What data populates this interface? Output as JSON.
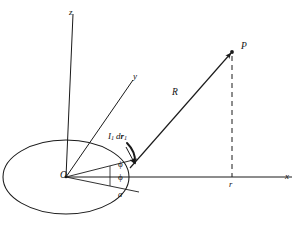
{
  "figure": {
    "kind": "vector-diagram",
    "background_color": "#ffffff",
    "stroke_color": "#1a1a1a"
  },
  "axes": {
    "z": {
      "label": "z",
      "x": 69,
      "y": 8
    },
    "y": {
      "label": "y",
      "x": 133,
      "y": 72
    },
    "x": {
      "label": "x",
      "x": 285,
      "y": 172
    }
  },
  "points": {
    "origin": {
      "label": "O",
      "x": 60,
      "y": 171
    },
    "field_point": {
      "label": "P",
      "x": 241,
      "y": 42
    }
  },
  "vectors": {
    "R": {
      "label": "R",
      "x": 172,
      "y": 88
    },
    "current_element": {
      "symbol_current": "I",
      "symbol_current_sub": "1",
      "symbol_d": "d",
      "symbol_vector": "r",
      "symbol_vector_sub": "1",
      "x": 108,
      "y": 132
    }
  },
  "angles": {
    "phi_upper": {
      "label": "ϕ",
      "x": 118,
      "y": 160
    },
    "phi_lower": {
      "label": "ϕ",
      "x": 118,
      "y": 173
    }
  },
  "lengths": {
    "loop_radius": {
      "label": "a",
      "x": 118,
      "y": 190
    },
    "field_distance": {
      "label": "r",
      "x": 229,
      "y": 180
    }
  },
  "geometry": {
    "origin_px": [
      66,
      177
    ],
    "loop_rx": 63,
    "loop_ry": 37,
    "z_axis_top": [
      73,
      14
    ],
    "y_axis_end": [
      133,
      80
    ],
    "x_axis_end": [
      292,
      177
    ],
    "point_P_px": [
      232,
      52
    ],
    "foot_px": [
      232,
      177
    ],
    "element_px": [
      136,
      160
    ]
  }
}
